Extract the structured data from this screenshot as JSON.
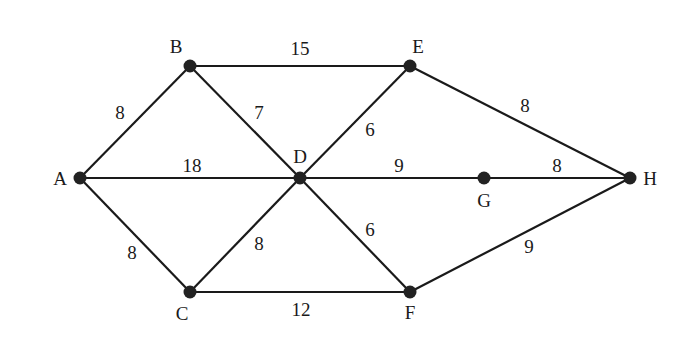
{
  "diagram": {
    "type": "weighted-undirected-graph",
    "colors": {
      "edge": "#1a1a1a",
      "node": "#222222",
      "text": "#1a1a1a",
      "background": "#ffffff"
    },
    "nodes": [
      {
        "id": "A",
        "label": "A",
        "x": 80,
        "y": 178,
        "lx": 60,
        "ly": 178
      },
      {
        "id": "B",
        "label": "B",
        "x": 190,
        "y": 66,
        "lx": 176,
        "ly": 46
      },
      {
        "id": "C",
        "label": "C",
        "x": 190,
        "y": 292,
        "lx": 182,
        "ly": 313
      },
      {
        "id": "D",
        "label": "D",
        "x": 300,
        "y": 178,
        "lx": 300,
        "ly": 156
      },
      {
        "id": "E",
        "label": "E",
        "x": 410,
        "y": 66,
        "lx": 418,
        "ly": 46
      },
      {
        "id": "F",
        "label": "F",
        "x": 410,
        "y": 292,
        "lx": 410,
        "ly": 312
      },
      {
        "id": "G",
        "label": "G",
        "x": 484,
        "y": 178,
        "lx": 484,
        "ly": 200
      },
      {
        "id": "H",
        "label": "H",
        "x": 630,
        "y": 178,
        "lx": 650,
        "ly": 178
      }
    ],
    "edges": [
      {
        "from": "A",
        "to": "B",
        "weight": "8",
        "wx": 120,
        "wy": 112
      },
      {
        "from": "A",
        "to": "D",
        "weight": "18",
        "wx": 192,
        "wy": 165
      },
      {
        "from": "A",
        "to": "C",
        "weight": "8",
        "wx": 132,
        "wy": 252
      },
      {
        "from": "B",
        "to": "E",
        "weight": "15",
        "wx": 300,
        "wy": 48
      },
      {
        "from": "B",
        "to": "D",
        "weight": "7",
        "wx": 259,
        "wy": 112
      },
      {
        "from": "D",
        "to": "E",
        "weight": "6",
        "wx": 370,
        "wy": 129
      },
      {
        "from": "D",
        "to": "G",
        "weight": "9",
        "wx": 399,
        "wy": 165
      },
      {
        "from": "G",
        "to": "H",
        "weight": "8",
        "wx": 557,
        "wy": 165
      },
      {
        "from": "E",
        "to": "H",
        "weight": "8",
        "wx": 525,
        "wy": 105
      },
      {
        "from": "C",
        "to": "D",
        "weight": "8",
        "wx": 259,
        "wy": 243
      },
      {
        "from": "D",
        "to": "F",
        "weight": "6",
        "wx": 370,
        "wy": 229
      },
      {
        "from": "C",
        "to": "F",
        "weight": "12",
        "wx": 301,
        "wy": 309
      },
      {
        "from": "F",
        "to": "H",
        "weight": "9",
        "wx": 529,
        "wy": 246
      }
    ]
  }
}
